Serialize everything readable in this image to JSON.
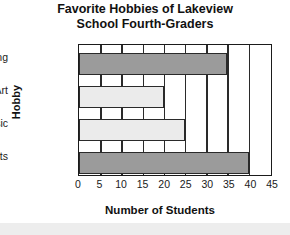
{
  "chart_data": {
    "type": "bar",
    "orientation": "horizontal",
    "title": "Favorite Hobbies of Lakeview School Fourth-Graders",
    "title_lines": [
      "Favorite Hobbies of Lakeview",
      "School Fourth-Graders"
    ],
    "categories": [
      "Reading",
      "Art",
      "Music",
      "Sports"
    ],
    "values": [
      35,
      20,
      25,
      40
    ],
    "xlabel": "Number of Students",
    "ylabel": "Hobby",
    "xlim": [
      0,
      45
    ],
    "xticks": [
      0,
      5,
      10,
      15,
      20,
      25,
      30,
      35,
      40,
      45
    ],
    "xtick_labels": [
      "0",
      "5",
      "10",
      "15",
      "20",
      "25",
      "30",
      "35",
      "40",
      "45"
    ],
    "grid": true,
    "grid_axis": "x",
    "legend": false,
    "bar_colors": [
      "#9b9b9b",
      "#ebebeb",
      "#ebebeb",
      "#9b9b9b"
    ],
    "bar_edge_color": "#2a2a2a",
    "plot_background": "#ffffff",
    "figure_background": "#ffffff"
  }
}
